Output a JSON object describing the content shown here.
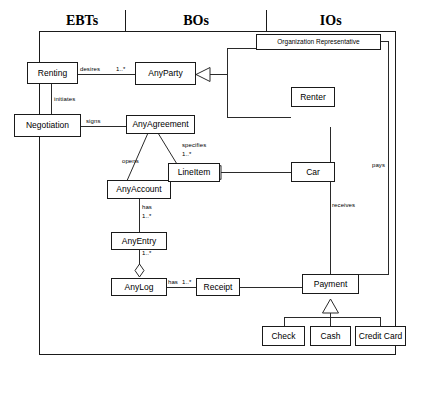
{
  "diagram": {
    "type": "uml-class-diagram",
    "caption": "",
    "columns": [
      {
        "id": "ebts",
        "label": "EBTs",
        "fill": "#8e8e8e"
      },
      {
        "id": "bos",
        "label": "BOs",
        "fill": "#cdcdcd"
      },
      {
        "id": "ios",
        "label": "IOs",
        "fill": "#ffffff"
      }
    ],
    "nodes": [
      {
        "id": "renting",
        "label": "Renting",
        "column": "ebts"
      },
      {
        "id": "negotiation",
        "label": "Negotiation",
        "column": "ebts"
      },
      {
        "id": "anyparty",
        "label": "AnyParty",
        "column": "bos"
      },
      {
        "id": "anyagreement",
        "label": "AnyAgreement",
        "column": "bos"
      },
      {
        "id": "anyaccount",
        "label": "AnyAccount",
        "column": "bos"
      },
      {
        "id": "lineitem",
        "label": "LineItem",
        "column": "bos"
      },
      {
        "id": "anyentry",
        "label": "AnyEntry",
        "column": "bos"
      },
      {
        "id": "anylog",
        "label": "AnyLog",
        "column": "bos"
      },
      {
        "id": "receipt",
        "label": "Receipt",
        "column": "bos"
      },
      {
        "id": "orgrep",
        "label": "Organization Representative",
        "column": "ios"
      },
      {
        "id": "renter",
        "label": "Renter",
        "column": "ios"
      },
      {
        "id": "car",
        "label": "Car",
        "column": "ios"
      },
      {
        "id": "payment",
        "label": "Payment",
        "column": "ios"
      },
      {
        "id": "check",
        "label": "Check",
        "column": "ios"
      },
      {
        "id": "cash",
        "label": "Cash",
        "column": "ios"
      },
      {
        "id": "creditcard",
        "label": "Credit Card",
        "column": "ios"
      }
    ],
    "edge_labels": {
      "desires": "desires",
      "desires_mult": "1..*",
      "initiates": "initiates",
      "signs": "signs",
      "opens": "opens",
      "specifies": "specifies",
      "specifies_mult": "1..*",
      "has_entry": "has",
      "has_entry_mult": "1..*",
      "log_mult": "1..*",
      "has_receipt": "has",
      "has_receipt_mult": "1..*",
      "receives": "receives",
      "pays": "pays"
    },
    "relationships": [
      {
        "from": "renting",
        "to": "anyparty",
        "label": "desires",
        "multiplicity": "1..*",
        "kind": "association"
      },
      {
        "from": "renting",
        "to": "negotiation",
        "label": "initiates",
        "multiplicity": "",
        "kind": "association"
      },
      {
        "from": "negotiation",
        "to": "anyagreement",
        "label": "signs",
        "multiplicity": "",
        "kind": "association"
      },
      {
        "from": "anyagreement",
        "to": "anyaccount",
        "label": "opens",
        "multiplicity": "",
        "kind": "association"
      },
      {
        "from": "anyagreement",
        "to": "lineitem",
        "label": "specifies",
        "multiplicity": "1..*",
        "kind": "association"
      },
      {
        "from": "anyaccount",
        "to": "anyentry",
        "label": "has",
        "multiplicity": "1..*",
        "kind": "association"
      },
      {
        "from": "anyentry",
        "to": "anylog",
        "label": "",
        "multiplicity": "1..*",
        "kind": "aggregation"
      },
      {
        "from": "anylog",
        "to": "receipt",
        "label": "has",
        "multiplicity": "1..*",
        "kind": "association"
      },
      {
        "from": "orgrep",
        "to": "anyparty",
        "label": "",
        "multiplicity": "",
        "kind": "generalization"
      },
      {
        "from": "renter",
        "to": "anyparty",
        "label": "",
        "multiplicity": "",
        "kind": "generalization"
      },
      {
        "from": "car",
        "to": "lineitem",
        "label": "",
        "multiplicity": "",
        "kind": "generalization"
      },
      {
        "from": "renter",
        "to": "payment",
        "label": "receives",
        "multiplicity": "",
        "kind": "association"
      },
      {
        "from": "orgrep",
        "to": "payment",
        "label": "pays",
        "multiplicity": "",
        "kind": "association"
      },
      {
        "from": "receipt",
        "to": "payment",
        "label": "",
        "multiplicity": "",
        "kind": "association"
      },
      {
        "from": "check",
        "to": "payment",
        "label": "",
        "multiplicity": "",
        "kind": "generalization"
      },
      {
        "from": "cash",
        "to": "payment",
        "label": "",
        "multiplicity": "",
        "kind": "generalization"
      },
      {
        "from": "creditcard",
        "to": "payment",
        "label": "",
        "multiplicity": "",
        "kind": "generalization"
      }
    ]
  }
}
